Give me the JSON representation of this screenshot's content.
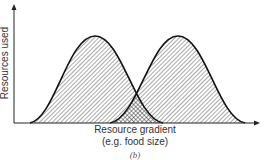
{
  "figure": {
    "panel_label": "(b)",
    "y_axis_label": "Resources used",
    "x_axis_label_line1": "Resource gradient",
    "x_axis_label_line2": "(e.g. food size)"
  },
  "curves": [
    {
      "name": "species-1",
      "peak_x": 95,
      "start_x": 30,
      "end_x": 163,
      "fill": "diagonal-hatch"
    },
    {
      "name": "species-2",
      "peak_x": 178,
      "start_x": 110,
      "end_x": 245,
      "fill": "diagonal-hatch"
    }
  ],
  "overlap": {
    "fill": "cross-hatch",
    "meaning": "shared resource use"
  },
  "colors": {
    "line": "#111111",
    "hatch": "#555555",
    "background": "#ffffff"
  }
}
